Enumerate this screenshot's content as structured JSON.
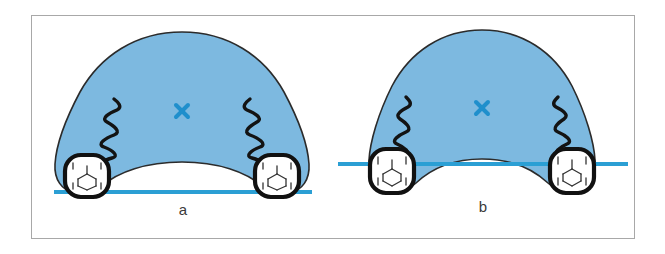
{
  "figure": {
    "frame": {
      "border_color": "#a8a8a8",
      "background": "#ffffff"
    },
    "colors": {
      "arch_fill": "#7db9e0",
      "arch_outline": "#2b2b2b",
      "reference_line": "#2b9fd4",
      "cross_marker": "#1f8fcc",
      "molar_fill": "#ffffff",
      "molar_outline": "#111111",
      "fissure_line": "#333333",
      "label_text": "#3a3a3a"
    },
    "panels": [
      {
        "id": "a",
        "label": "a",
        "arch_shape": "broad-ovoid",
        "reference_line": {
          "position": "below-molars",
          "description": "horizontal blue line tangent to the occlusal plane beneath both molars",
          "y": 175,
          "x_start": 22,
          "x_end": 280
        },
        "cross_marker": {
          "symbol": "x",
          "x": 150,
          "y": 95
        },
        "molars": [
          {
            "side": "left",
            "cx": 55,
            "cy": 155
          },
          {
            "side": "right",
            "cx": 245,
            "cy": 155
          }
        ],
        "squiggles": [
          {
            "side": "left"
          },
          {
            "side": "right"
          }
        ]
      },
      {
        "id": "b",
        "label": "b",
        "arch_shape": "narrow-tapered",
        "reference_line": {
          "position": "through-molars",
          "description": "horizontal blue line crossing through both molar crowns",
          "y": 147,
          "x_start": 8,
          "x_end": 292
        },
        "cross_marker": {
          "symbol": "x",
          "x": 150,
          "y": 92
        },
        "molars": [
          {
            "side": "left",
            "cx": 60,
            "cy": 160
          },
          {
            "side": "right",
            "cx": 240,
            "cy": 160
          }
        ],
        "squiggles": [
          {
            "side": "left"
          },
          {
            "side": "right"
          }
        ]
      }
    ]
  }
}
